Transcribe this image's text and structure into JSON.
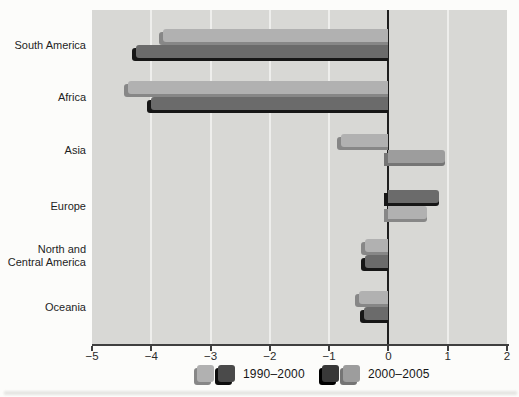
{
  "chart_data": {
    "type": "bar",
    "orientation": "horizontal",
    "title": "",
    "xlabel": "",
    "ylabel": "",
    "xlim": [
      -5,
      2
    ],
    "xticks": [
      -5,
      -4,
      -3,
      -2,
      -1,
      0,
      1,
      2
    ],
    "gridlines_at": [
      -4,
      -3,
      -2,
      -1,
      1
    ],
    "grid": true,
    "categories": [
      "South America",
      "Africa",
      "Asia",
      "Europe",
      "North and\nCentral America",
      "Oceania"
    ],
    "series": [
      {
        "name": "1990–2000",
        "values": [
          -3.8,
          -4.4,
          -0.8,
          0.85,
          -0.4,
          -0.5
        ]
      },
      {
        "name": "2000–2005",
        "values": [
          -4.25,
          -4.0,
          0.95,
          0.65,
          -0.4,
          -0.42
        ]
      }
    ],
    "bar_tones": [
      [
        "light",
        "dark"
      ],
      [
        "light",
        "dark"
      ],
      [
        "light",
        "medium"
      ],
      [
        "dark",
        "light"
      ],
      [
        "light",
        "dark"
      ],
      [
        "light",
        "dark"
      ]
    ],
    "legend": {
      "position": "bottom",
      "entries": [
        {
          "label": "1990–2000",
          "swatch_tones": [
            "light",
            "dark_swatch"
          ]
        },
        {
          "label": "2000–2005",
          "swatch_tones": [
            "darkest_swatch",
            "medium"
          ]
        }
      ]
    },
    "colors": {
      "plot_bg": "#d8d8d5",
      "gridline": "#eeeeec",
      "axis_line": "#3f3f3f",
      "zero_line": "#1f1f1f",
      "light": "#b1b1b1",
      "light_bevel": "#878787",
      "medium": "#9d9d9d",
      "medium_bevel": "#757575",
      "dark": "#6b6b6b",
      "dark_bevel": "#161616",
      "dark_swatch": "#4a4a4a",
      "dark_swatch_bevel": "#0d0d0d",
      "darkest_swatch": "#383838",
      "darkest_swatch_bevel": "#000000"
    }
  }
}
